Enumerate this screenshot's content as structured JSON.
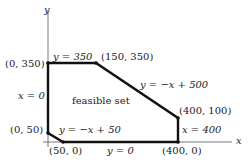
{
  "diagram": {
    "axes": {
      "x_label": "x",
      "y_label": "y"
    },
    "region_label": "feasible set",
    "vertices": [
      {
        "label": "(0, 350)"
      },
      {
        "label": "(150, 350)"
      },
      {
        "label": "(400, 100)"
      },
      {
        "label": "(400, 0)"
      },
      {
        "label": "(50, 0)"
      },
      {
        "label": "(0, 50)"
      }
    ],
    "edges": [
      {
        "label": "y = 350"
      },
      {
        "label": "y = −x + 500"
      },
      {
        "label": "x = 400"
      },
      {
        "label": "y = 0"
      },
      {
        "label": "y = −x + 50"
      },
      {
        "label": "x = 0"
      }
    ],
    "colors": {
      "edge": "#111111",
      "axis": "#555555",
      "text": "#222222"
    }
  }
}
